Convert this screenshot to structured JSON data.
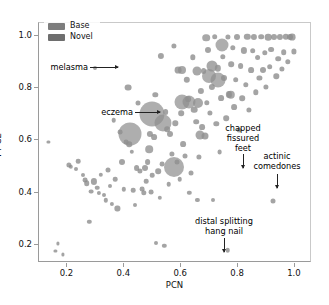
{
  "chart_data": {
    "type": "scatter",
    "title": "",
    "xlabel": "PCN",
    "ylabel": "FT-CE",
    "xlim": [
      0.1,
      1.06
    ],
    "ylim": [
      0.13,
      1.05
    ],
    "xticks": [
      0.2,
      0.4,
      0.6,
      0.8,
      1.0
    ],
    "xticklabels": [
      "0.2",
      "0.4",
      "0.6",
      "0.8",
      "1.0"
    ],
    "yticks": [
      0.2,
      0.4,
      0.6,
      0.8,
      1.0
    ],
    "yticklabels": [
      "0.2",
      "0.4",
      "0.6",
      "0.8",
      "1.0"
    ],
    "grid": false,
    "legend_position": "upper left",
    "marker_shape": "circle",
    "size_encodes": "bubble area",
    "legend": [
      {
        "label": "Base",
        "color": "#7d7d7d"
      },
      {
        "label": "Novel",
        "color": "#6e6e6e"
      }
    ],
    "series": [
      {
        "name": "Base",
        "color": "#8a8a8a",
        "points": [
          {
            "x": 0.133,
            "y": 0.595,
            "s": 1.6
          },
          {
            "x": 0.158,
            "y": 0.176,
            "s": 1.6
          },
          {
            "x": 0.167,
            "y": 0.205,
            "s": 1.6
          },
          {
            "x": 0.185,
            "y": 0.163,
            "s": 1.6
          },
          {
            "x": 0.205,
            "y": 0.505,
            "s": 2.6
          },
          {
            "x": 0.212,
            "y": 0.499,
            "s": 2.2
          },
          {
            "x": 0.231,
            "y": 0.492,
            "s": 2.0
          },
          {
            "x": 0.238,
            "y": 0.521,
            "s": 2.3
          },
          {
            "x": 0.255,
            "y": 0.468,
            "s": 2.0
          },
          {
            "x": 0.262,
            "y": 0.449,
            "s": 2.4
          },
          {
            "x": 0.268,
            "y": 0.437,
            "s": 2.8
          },
          {
            "x": 0.277,
            "y": 0.289,
            "s": 2.2
          },
          {
            "x": 0.282,
            "y": 0.404,
            "s": 2.4
          },
          {
            "x": 0.292,
            "y": 0.443,
            "s": 3.1
          },
          {
            "x": 0.297,
            "y": 0.876,
            "s": 2.0
          },
          {
            "x": 0.305,
            "y": 0.419,
            "s": 2.3
          },
          {
            "x": 0.312,
            "y": 0.398,
            "s": 2.1
          },
          {
            "x": 0.318,
            "y": 0.468,
            "s": 2.2
          },
          {
            "x": 0.327,
            "y": 0.389,
            "s": 2.0
          },
          {
            "x": 0.334,
            "y": 0.371,
            "s": 2.2
          },
          {
            "x": 0.341,
            "y": 0.487,
            "s": 2.5
          },
          {
            "x": 0.349,
            "y": 0.425,
            "s": 2.0
          },
          {
            "x": 0.355,
            "y": 0.358,
            "s": 2.1
          },
          {
            "x": 0.362,
            "y": 0.677,
            "s": 2.3
          },
          {
            "x": 0.369,
            "y": 0.452,
            "s": 2.3
          },
          {
            "x": 0.376,
            "y": 0.339,
            "s": 2.6
          },
          {
            "x": 0.385,
            "y": 0.632,
            "s": 2.4
          },
          {
            "x": 0.392,
            "y": 0.519,
            "s": 3.0
          },
          {
            "x": 0.399,
            "y": 0.412,
            "s": 2.2
          },
          {
            "x": 0.405,
            "y": 0.592,
            "s": 2.4
          },
          {
            "x": 0.413,
            "y": 0.802,
            "s": 3.4
          },
          {
            "x": 0.418,
            "y": 0.585,
            "s": 2.8
          },
          {
            "x": 0.427,
            "y": 0.556,
            "s": 2.2
          },
          {
            "x": 0.432,
            "y": 0.409,
            "s": 2.3
          },
          {
            "x": 0.438,
            "y": 0.351,
            "s": 2.0
          },
          {
            "x": 0.443,
            "y": 0.493,
            "s": 2.9
          },
          {
            "x": 0.449,
            "y": 0.744,
            "s": 2.5
          },
          {
            "x": 0.454,
            "y": 0.482,
            "s": 2.6
          },
          {
            "x": 0.462,
            "y": 0.413,
            "s": 2.4
          },
          {
            "x": 0.468,
            "y": 0.399,
            "s": 2.7
          },
          {
            "x": 0.473,
            "y": 0.495,
            "s": 3.0
          },
          {
            "x": 0.478,
            "y": 0.443,
            "s": 2.3
          },
          {
            "x": 0.482,
            "y": 0.516,
            "s": 2.9
          },
          {
            "x": 0.489,
            "y": 0.626,
            "s": 3.1
          },
          {
            "x": 0.494,
            "y": 0.402,
            "s": 2.4
          },
          {
            "x": 0.499,
            "y": 0.467,
            "s": 2.3
          },
          {
            "x": 0.504,
            "y": 0.613,
            "s": 2.9
          },
          {
            "x": 0.509,
            "y": 0.775,
            "s": 2.7
          },
          {
            "x": 0.513,
            "y": 0.205,
            "s": 2.0
          },
          {
            "x": 0.519,
            "y": 0.483,
            "s": 2.8
          },
          {
            "x": 0.524,
            "y": 0.381,
            "s": 2.2
          },
          {
            "x": 0.529,
            "y": 0.925,
            "s": 3.1
          },
          {
            "x": 0.534,
            "y": 0.509,
            "s": 2.4
          },
          {
            "x": 0.54,
            "y": 0.196,
            "s": 2.2
          },
          {
            "x": 0.545,
            "y": 0.709,
            "s": 2.9
          },
          {
            "x": 0.551,
            "y": 0.643,
            "s": 2.8
          },
          {
            "x": 0.556,
            "y": 0.432,
            "s": 2.3
          },
          {
            "x": 0.562,
            "y": 0.625,
            "s": 3.0
          },
          {
            "x": 0.568,
            "y": 0.547,
            "s": 2.6
          },
          {
            "x": 0.573,
            "y": 0.962,
            "s": 2.6
          },
          {
            "x": 0.579,
            "y": 0.665,
            "s": 2.7
          },
          {
            "x": 0.584,
            "y": 0.519,
            "s": 2.5
          },
          {
            "x": 0.589,
            "y": 0.868,
            "s": 3.4
          },
          {
            "x": 0.595,
            "y": 0.452,
            "s": 2.3
          },
          {
            "x": 0.601,
            "y": 0.704,
            "s": 2.8
          },
          {
            "x": 0.607,
            "y": 0.587,
            "s": 2.9
          },
          {
            "x": 0.612,
            "y": 0.541,
            "s": 2.5
          },
          {
            "x": 0.619,
            "y": 0.833,
            "s": 3.2
          },
          {
            "x": 0.624,
            "y": 0.757,
            "s": 2.9
          },
          {
            "x": 0.629,
            "y": 0.398,
            "s": 2.2
          },
          {
            "x": 0.634,
            "y": 0.474,
            "s": 2.5
          },
          {
            "x": 0.641,
            "y": 0.919,
            "s": 2.7
          },
          {
            "x": 0.646,
            "y": 0.718,
            "s": 3.3
          },
          {
            "x": 0.652,
            "y": 0.672,
            "s": 2.8
          },
          {
            "x": 0.657,
            "y": 0.371,
            "s": 2.1
          },
          {
            "x": 0.663,
            "y": 0.537,
            "s": 2.6
          },
          {
            "x": 0.668,
            "y": 0.789,
            "s": 3.1
          },
          {
            "x": 0.673,
            "y": 0.651,
            "s": 2.9
          },
          {
            "x": 0.679,
            "y": 0.866,
            "s": 2.9
          },
          {
            "x": 0.684,
            "y": 0.615,
            "s": 3.5
          },
          {
            "x": 0.69,
            "y": 0.745,
            "s": 2.7
          },
          {
            "x": 0.695,
            "y": 0.948,
            "s": 3.0
          },
          {
            "x": 0.701,
            "y": 0.706,
            "s": 2.6
          },
          {
            "x": 0.707,
            "y": 0.805,
            "s": 3.1
          },
          {
            "x": 0.712,
            "y": 0.372,
            "s": 2.0
          },
          {
            "x": 0.718,
            "y": 0.998,
            "s": 2.8
          },
          {
            "x": 0.723,
            "y": 0.663,
            "s": 2.7
          },
          {
            "x": 0.729,
            "y": 0.877,
            "s": 3.2
          },
          {
            "x": 0.735,
            "y": 0.556,
            "s": 2.4
          },
          {
            "x": 0.741,
            "y": 0.762,
            "s": 2.9
          },
          {
            "x": 0.746,
            "y": 0.921,
            "s": 2.7
          },
          {
            "x": 0.752,
            "y": 0.841,
            "s": 3.0
          },
          {
            "x": 0.758,
            "y": 0.684,
            "s": 2.8
          },
          {
            "x": 0.763,
            "y": 0.996,
            "s": 2.6
          },
          {
            "x": 0.764,
            "y": 0.179,
            "s": 2.3
          },
          {
            "x": 0.769,
            "y": 0.776,
            "s": 3.1
          },
          {
            "x": 0.775,
            "y": 0.893,
            "s": 2.8
          },
          {
            "x": 0.781,
            "y": 0.955,
            "s": 2.7
          },
          {
            "x": 0.786,
            "y": 0.729,
            "s": 2.9
          },
          {
            "x": 0.792,
            "y": 0.832,
            "s": 2.8
          },
          {
            "x": 0.798,
            "y": 0.997,
            "s": 3.0
          },
          {
            "x": 0.803,
            "y": 0.638,
            "s": 2.5
          },
          {
            "x": 0.809,
            "y": 0.884,
            "s": 2.9
          },
          {
            "x": 0.815,
            "y": 0.761,
            "s": 2.8
          },
          {
            "x": 0.821,
            "y": 0.945,
            "s": 3.1
          },
          {
            "x": 0.827,
            "y": 0.812,
            "s": 2.7
          },
          {
            "x": 0.833,
            "y": 0.997,
            "s": 3.2
          },
          {
            "x": 0.838,
            "y": 0.716,
            "s": 2.6
          },
          {
            "x": 0.845,
            "y": 0.869,
            "s": 2.9
          },
          {
            "x": 0.851,
            "y": 0.944,
            "s": 2.8
          },
          {
            "x": 0.857,
            "y": 0.998,
            "s": 3.1
          },
          {
            "x": 0.863,
            "y": 0.784,
            "s": 2.7
          },
          {
            "x": 0.869,
            "y": 0.917,
            "s": 2.9
          },
          {
            "x": 0.875,
            "y": 0.839,
            "s": 2.6
          },
          {
            "x": 0.881,
            "y": 0.997,
            "s": 2.8
          },
          {
            "x": 0.887,
            "y": 0.871,
            "s": 3.0
          },
          {
            "x": 0.893,
            "y": 0.935,
            "s": 2.7
          },
          {
            "x": 0.899,
            "y": 0.805,
            "s": 2.6
          },
          {
            "x": 0.905,
            "y": 0.996,
            "s": 3.3
          },
          {
            "x": 0.911,
            "y": 0.882,
            "s": 2.8
          },
          {
            "x": 0.917,
            "y": 0.948,
            "s": 2.9
          },
          {
            "x": 0.923,
            "y": 0.366,
            "s": 2.5
          },
          {
            "x": 0.928,
            "y": 0.998,
            "s": 3.0
          },
          {
            "x": 0.934,
            "y": 0.846,
            "s": 2.7
          },
          {
            "x": 0.941,
            "y": 0.913,
            "s": 2.8
          },
          {
            "x": 0.947,
            "y": 0.997,
            "s": 3.1
          },
          {
            "x": 0.954,
            "y": 0.874,
            "s": 2.6
          },
          {
            "x": 0.961,
            "y": 0.939,
            "s": 2.8
          },
          {
            "x": 0.968,
            "y": 0.997,
            "s": 3.2
          },
          {
            "x": 0.975,
            "y": 0.901,
            "s": 2.7
          },
          {
            "x": 0.982,
            "y": 0.998,
            "s": 3.0
          },
          {
            "x": 0.991,
            "y": 0.996,
            "s": 3.4
          },
          {
            "x": 0.997,
            "y": 0.941,
            "s": 2.6
          }
        ]
      },
      {
        "name": "Novel",
        "color": "#8f8f8f",
        "points": [
          {
            "x": 0.42,
            "y": 0.625,
            "s": 11.5
          },
          {
            "x": 0.497,
            "y": 0.703,
            "s": 12.5
          },
          {
            "x": 0.535,
            "y": 0.668,
            "s": 8.5
          },
          {
            "x": 0.573,
            "y": 0.497,
            "s": 10.0
          },
          {
            "x": 0.603,
            "y": 0.748,
            "s": 7.5
          },
          {
            "x": 0.629,
            "y": 0.747,
            "s": 6.5
          },
          {
            "x": 0.659,
            "y": 0.745,
            "s": 5.0
          },
          {
            "x": 0.697,
            "y": 0.845,
            "s": 7.0
          },
          {
            "x": 0.709,
            "y": 0.884,
            "s": 5.5
          },
          {
            "x": 0.731,
            "y": 0.831,
            "s": 7.5
          },
          {
            "x": 0.744,
            "y": 0.967,
            "s": 6.5
          },
          {
            "x": 0.655,
            "y": 0.866,
            "s": 4.5
          },
          {
            "x": 0.667,
            "y": 0.62,
            "s": 4.5
          },
          {
            "x": 0.487,
            "y": 0.566,
            "s": 3.8
          },
          {
            "x": 0.603,
            "y": 0.869,
            "s": 4.0
          },
          {
            "x": 0.774,
            "y": 0.775,
            "s": 4.2
          },
          {
            "x": 0.688,
            "y": 0.994,
            "s": 3.8
          }
        ]
      }
    ],
    "annotations": [
      {
        "name": "melasma",
        "text": "melasma",
        "arrow": "right"
      },
      {
        "name": "eczema",
        "text": "eczema",
        "arrow": "right"
      },
      {
        "name": "chapped-fissured-feet",
        "text": "chapped\nfissured\nfeet",
        "arrow": "down"
      },
      {
        "name": "actinic-comedones",
        "text": "actinic\ncomedones",
        "arrow": "down"
      },
      {
        "name": "distal-splitting-hang-nail",
        "text": "distal splitting\nhang nail",
        "arrow": "down"
      }
    ]
  },
  "annotations_text": {
    "melasma": "melasma",
    "eczema": "eczema",
    "chapped_1": "chapped",
    "chapped_2": "fissured",
    "chapped_3": "feet",
    "actinic_1": "actinic",
    "actinic_2": "comedones",
    "distal_1": "distal splitting",
    "distal_2": "hang nail"
  }
}
